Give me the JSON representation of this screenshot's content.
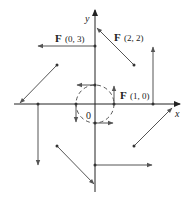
{
  "diagram": {
    "axes": {
      "x_label": "x",
      "y_label": "y",
      "origin_label": "0"
    },
    "annotations": [
      {
        "id": "F03",
        "text_bold": "F",
        "text": "(0, 3)"
      },
      {
        "id": "F22",
        "text_bold": "F",
        "text": "(2, 2)"
      },
      {
        "id": "F10",
        "text_bold": "F",
        "text": "(1, 0)"
      }
    ],
    "colors": {
      "axis": "#222222",
      "vector": "#555555",
      "circle": "#444444",
      "point": "#333333"
    }
  }
}
